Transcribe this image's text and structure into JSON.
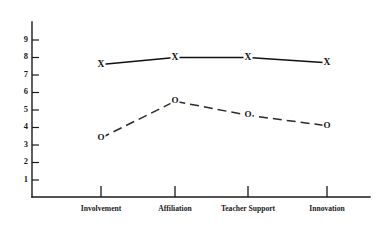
{
  "chart_data": {
    "type": "line",
    "title": "",
    "subtitle": "",
    "xlabel": "",
    "ylabel": "",
    "categories": [
      "Involvement",
      "Affiliation",
      "Teacher Support",
      "Innovation"
    ],
    "series": [
      {
        "name": "X",
        "marker": "X",
        "linestyle": "solid",
        "color": "#111111",
        "values": [
          7.6,
          8.0,
          8.0,
          7.7
        ]
      },
      {
        "name": "O",
        "marker": "O",
        "linestyle": "dashed",
        "color": "#2b2b2b",
        "values": [
          3.4,
          5.5,
          4.7,
          4.1
        ]
      }
    ],
    "ylim": [
      0,
      9.8
    ],
    "yticks": [
      1,
      2,
      3,
      4,
      5,
      6,
      7,
      8,
      9
    ],
    "ytick_labels": [
      "1",
      "2",
      "3",
      "4",
      "5",
      "6",
      "7",
      "8",
      "9"
    ],
    "grid": false,
    "legend": "none",
    "background_color": "#ffffff",
    "axis_color": "#1a1a1a"
  }
}
